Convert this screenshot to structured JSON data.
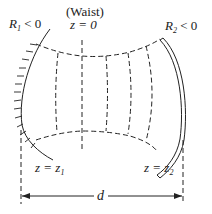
{
  "diagram": {
    "labels": {
      "r1_main": "R",
      "r1_sub": "1",
      "r1_rel": " < 0",
      "r2_main": "R",
      "r2_sub": "2",
      "r2_rel": " < 0",
      "waist": "(Waist)",
      "z0": "z = 0",
      "z1_main": "z = z",
      "z1_sub": "1",
      "z2_main": "z = z",
      "z2_sub": "2",
      "d": "d"
    },
    "colors": {
      "line": "#222222",
      "background": "#ffffff"
    }
  }
}
